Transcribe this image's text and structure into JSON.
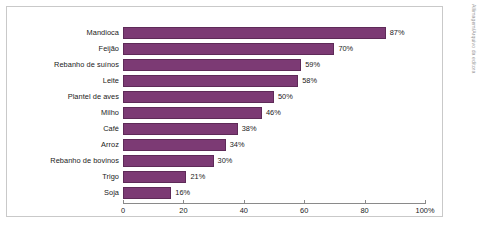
{
  "credit": "Allimagem/Arquivo da editora",
  "colors": {
    "bar_fill": "#7c3a74",
    "bar_stroke": "#5e2a58",
    "frame": "#c9c9c9",
    "axis": "#8a8a8a",
    "text": "#1a1a1a",
    "background": "#ffffff"
  },
  "chart_data": {
    "type": "bar",
    "orientation": "horizontal",
    "title": "",
    "subtitle": "",
    "xlabel": "",
    "ylabel": "",
    "xlim": [
      0,
      100
    ],
    "grid": false,
    "legend": false,
    "unit": "%",
    "categories": [
      "Mandioca",
      "Feijão",
      "Rebanho de suínos",
      "Leite",
      "Plantel de aves",
      "Milho",
      "Café",
      "Arroz",
      "Rebanho de bovinos",
      "Trigo",
      "Soja"
    ],
    "values": [
      87,
      70,
      59,
      58,
      50,
      46,
      38,
      34,
      30,
      21,
      16
    ],
    "data_labels": [
      "87%",
      "70%",
      "59%",
      "58%",
      "50%",
      "46%",
      "38%",
      "34%",
      "30%",
      "21%",
      "16%"
    ],
    "xticks": [
      0,
      20,
      40,
      60,
      80,
      100
    ],
    "xtick_labels": [
      "0",
      "20",
      "40",
      "60",
      "80",
      "100%"
    ]
  }
}
